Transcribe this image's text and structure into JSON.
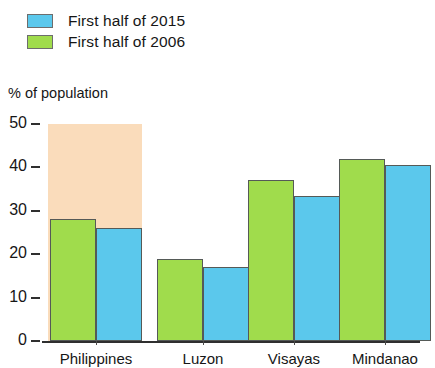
{
  "legend": {
    "items": [
      {
        "label": "First half of 2015",
        "color": "#5bc8ec",
        "series": "2015"
      },
      {
        "label": "First half of 2006",
        "color": "#a0dc4c",
        "series": "2006"
      }
    ]
  },
  "axis": {
    "y_title": "% of population"
  },
  "colors": {
    "blue_2015": "#5bc8ec",
    "green_2006": "#a0dc4c",
    "highlight_band": "#fadcbb",
    "axis_line": "#2f2f2f",
    "bar_outline": "#555a57"
  },
  "chart_data": {
    "type": "bar",
    "title": "",
    "subtitle": "",
    "xlabel": "",
    "ylabel": "% of population",
    "ylim": [
      0,
      50
    ],
    "yticks": [
      0,
      10,
      20,
      30,
      40,
      50
    ],
    "ytick_labels": [
      "0",
      "10",
      "20",
      "30",
      "40",
      "50"
    ],
    "grid": false,
    "legend_position": "top-left",
    "categories": [
      "Philippines",
      "Luzon",
      "Visayas",
      "Mindanao"
    ],
    "highlighted_category": "Philippines",
    "series": [
      {
        "name": "First half of 2006",
        "color": "#a0dc4c",
        "values": [
          28,
          19,
          37,
          42
        ]
      },
      {
        "name": "First half of 2015",
        "color": "#5bc8ec",
        "values": [
          26,
          17,
          33.5,
          40.5
        ]
      }
    ]
  }
}
